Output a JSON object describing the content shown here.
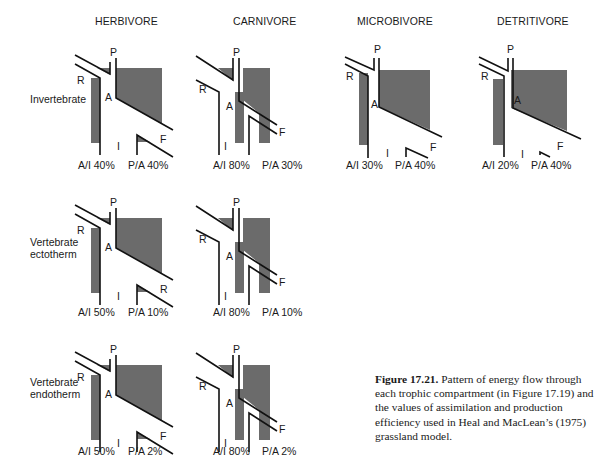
{
  "figure": {
    "columns": [
      {
        "key": "herbivore",
        "title": "HERBIVORE",
        "x": 95
      },
      {
        "key": "carnivore",
        "title": "CARNIVORE",
        "x": 233
      },
      {
        "key": "microbivore",
        "title": "MICROBIVORE",
        "x": 357
      },
      {
        "key": "detritivore",
        "title": "DETRITIVORE",
        "x": 497
      }
    ],
    "rows": [
      {
        "key": "invertebrate",
        "label_lines": [
          "Invertebrate"
        ],
        "label_x": 30,
        "label_y": 93
      },
      {
        "key": "vertebrate_ectotherm",
        "label_lines": [
          "Vertebrate",
          "ectotherm"
        ],
        "label_x": 30,
        "label_y": 241
      },
      {
        "key": "vertebrate_endotherm",
        "label_lines": [
          "Vertebrate",
          "endotherm"
        ],
        "label_x": 30,
        "label_y": 381
      }
    ],
    "flow_labels": {
      "respiration": "R",
      "production": "P",
      "assimilation": "A",
      "ingestion": "I",
      "feces": "F"
    },
    "panels": [
      {
        "id": "herbivore-invertebrate",
        "col": "herbivore",
        "row": "invertebrate",
        "ox": 0,
        "oy": 0,
        "ai": "A/I 40%",
        "pa": "P/A 40%",
        "ai_x": 78,
        "pa_x": 128,
        "eff_y": 159,
        "bottom_right_label": "F",
        "variant": "herb"
      },
      {
        "id": "carnivore-invertebrate",
        "col": "carnivore",
        "row": "invertebrate",
        "ox": 135,
        "oy": 0,
        "ai": "A/I 80%",
        "pa": "P/A 30%",
        "ai_x": 213,
        "pa_x": 262,
        "eff_y": 159,
        "bottom_right_label": "F",
        "variant": "carn"
      },
      {
        "id": "microbivore-invertebrate",
        "col": "microbivore",
        "row": "invertebrate",
        "ox": 0,
        "oy": 0,
        "ai": "A/I 30%",
        "pa": "P/A 40%",
        "ai_x": 346,
        "pa_x": 395,
        "eff_y": 159,
        "bottom_right_label": "F",
        "variant": "micro"
      },
      {
        "id": "detritivore-invertebrate",
        "col": "detritivore",
        "row": "invertebrate",
        "ox": 0,
        "oy": 0,
        "ai": "A/I 20%",
        "pa": "P/A 40%",
        "ai_x": 482,
        "pa_x": 531,
        "eff_y": 159,
        "bottom_right_label": "F",
        "variant": "detr"
      },
      {
        "id": "herbivore-vertebrate-ectotherm",
        "col": "herbivore",
        "row": "vertebrate_ectotherm",
        "ox": 0,
        "oy": 150,
        "ai": "A/I 50%",
        "pa": "P/A 10%",
        "ai_x": 78,
        "pa_x": 128,
        "eff_y": 306,
        "bottom_right_label": "R",
        "variant": "herb"
      },
      {
        "id": "carnivore-vertebrate-ectotherm",
        "col": "carnivore",
        "row": "vertebrate_ectotherm",
        "ox": 135,
        "oy": 150,
        "ai": "A/I 80%",
        "pa": "P/A 10%",
        "ai_x": 213,
        "pa_x": 262,
        "eff_y": 306,
        "bottom_right_label": "F",
        "variant": "carn"
      },
      {
        "id": "herbivore-vertebrate-endotherm",
        "col": "herbivore",
        "row": "vertebrate_endotherm",
        "ox": 0,
        "oy": 297,
        "ai": "A/I 50%",
        "pa": "P/A 2%",
        "ai_x": 78,
        "pa_x": 128,
        "eff_y": 445,
        "bottom_right_label": "F",
        "variant": "herb"
      },
      {
        "id": "carnivore-vertebrate-endotherm",
        "col": "carnivore",
        "row": "vertebrate_endotherm",
        "ox": 135,
        "oy": 297,
        "ai": "A/I 80%",
        "pa": "P/A 2%",
        "ai_x": 213,
        "pa_x": 262,
        "eff_y": 445,
        "bottom_right_label": "F",
        "variant": "carn"
      }
    ],
    "caption": {
      "label": "Figure 17.21.",
      "text": " Pattern of energy flow through each trophic compartment (in Figure 17.19) and the values of assimilation and production efficiency used in Heal and MacLean’s (1975) grassland model."
    },
    "colors": {
      "fill": "#6b6b6b",
      "stroke": "#111111",
      "background": "#ffffff"
    }
  }
}
